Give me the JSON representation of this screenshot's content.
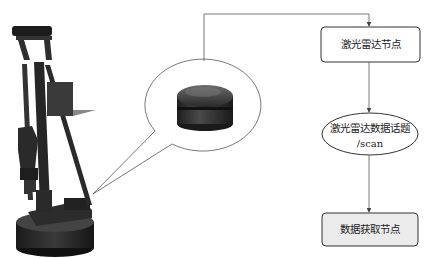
{
  "diagram": {
    "type": "flowchart-with-illustration",
    "illustration": {
      "robot": "mobile robot arm with lidar mounted on base",
      "callout": "lidar sensor close-up"
    },
    "nodes": [
      {
        "id": "lidar_node",
        "shape": "rounded-rect",
        "label": "激光雷达节点",
        "fill": "#ffffff"
      },
      {
        "id": "scan_topic",
        "shape": "ellipse",
        "label": "激光雷达数据话题",
        "sublabel": "/scan",
        "fill": "#ffffff"
      },
      {
        "id": "data_node",
        "shape": "rounded-rect",
        "label": "数据获取节点",
        "fill": "#ebebeb"
      }
    ],
    "edges": [
      {
        "from": "callout",
        "to": "lidar_node"
      },
      {
        "from": "lidar_node",
        "to": "scan_topic"
      },
      {
        "from": "scan_topic",
        "to": "data_node"
      }
    ],
    "colors": {
      "stroke": "#333333",
      "line": "#555555",
      "box_fill_highlight": "#ebebeb"
    }
  }
}
